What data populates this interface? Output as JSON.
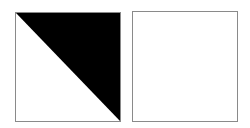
{
  "diagram": {
    "background": "#ffffff",
    "shapes": [
      {
        "id": "left-square",
        "type": "square",
        "x": 15,
        "y": 12,
        "width": 106,
        "height": 110,
        "border_color": "#8a8a8a",
        "fill": "#ffffff",
        "overlay": {
          "type": "triangle",
          "description": "upper-right half filled black, split along diagonal from top-left to bottom-right",
          "fill": "#000000",
          "points": "0,0 100,0 100,100"
        }
      },
      {
        "id": "right-square",
        "type": "square",
        "x": 132,
        "y": 11,
        "width": 106,
        "height": 111,
        "border_color": "#8a8a8a",
        "fill": "#ffffff"
      }
    ]
  }
}
